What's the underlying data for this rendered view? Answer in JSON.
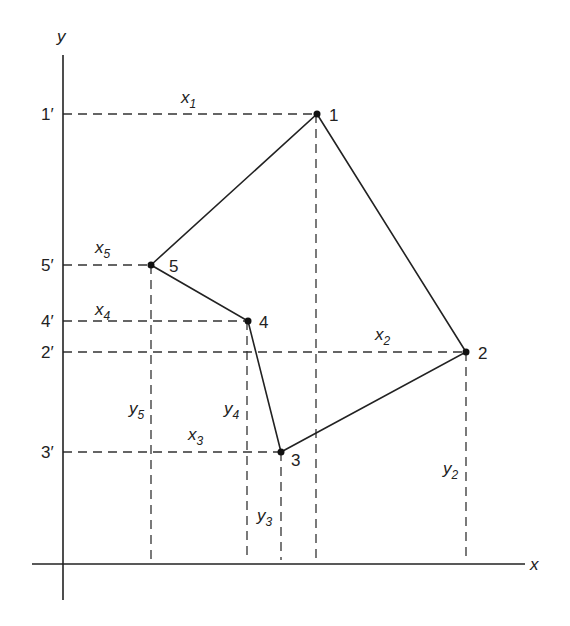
{
  "axes": {
    "x_label": "x",
    "y_label": "y",
    "origin": [
      63,
      564
    ]
  },
  "colors": {
    "line": "#222222",
    "background": "#ffffff"
  },
  "vertices": [
    {
      "id": "1",
      "label": "1",
      "px": [
        317,
        114
      ],
      "proj_label": "1′",
      "x_label": "x",
      "x_sub": "1",
      "y_label": null,
      "y_sub": null
    },
    {
      "id": "2",
      "label": "2",
      "px": [
        466,
        352
      ],
      "proj_label": "2′",
      "x_label": "x",
      "x_sub": "2",
      "y_label": "y",
      "y_sub": "2"
    },
    {
      "id": "3",
      "label": "3",
      "px": [
        281,
        452
      ],
      "proj_label": "3′",
      "x_label": "x",
      "x_sub": "3",
      "y_label": "y",
      "y_sub": "3"
    },
    {
      "id": "4",
      "label": "4",
      "px": [
        248,
        321
      ],
      "proj_label": "4′",
      "x_label": "x",
      "x_sub": "4",
      "y_label": "y",
      "y_sub": "4"
    },
    {
      "id": "5",
      "label": "5",
      "px": [
        151,
        265
      ],
      "proj_label": "5′",
      "x_label": "x",
      "x_sub": "5",
      "y_label": "y",
      "y_sub": "5"
    }
  ],
  "polygon_order": [
    "1",
    "2",
    "3",
    "4",
    "5"
  ],
  "labels": {
    "v1": "1",
    "v2": "2",
    "v3": "3",
    "v4": "4",
    "v5": "5",
    "p1": "1′",
    "p2": "2′",
    "p3": "3′",
    "p4": "4′",
    "p5": "5′",
    "x": "x",
    "y": "y",
    "sub1": "1",
    "sub2": "2",
    "sub3": "3",
    "sub4": "4",
    "sub5": "5"
  }
}
